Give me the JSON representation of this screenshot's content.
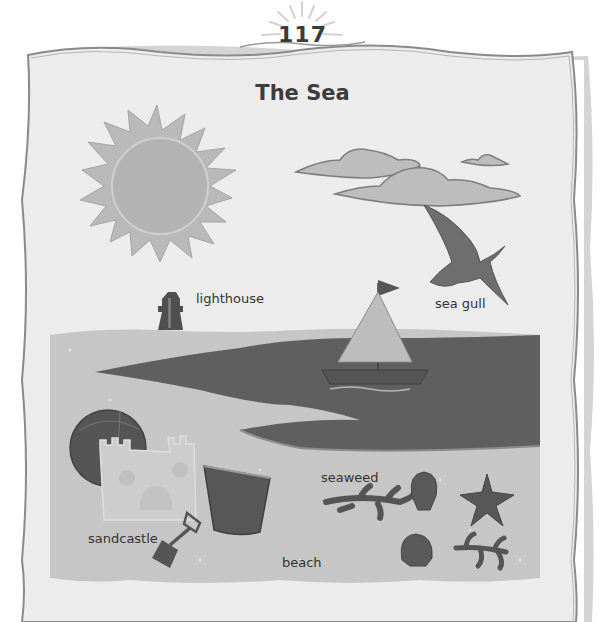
{
  "page": {
    "number": "117",
    "title": "The Sea"
  },
  "labels": {
    "lighthouse": "lighthouse",
    "sea_gull": "sea gull",
    "seaweed": "seaweed",
    "sandcastle": "sandcastle",
    "beach": "beach"
  },
  "colors": {
    "paper": "#ebebeb",
    "border": "#8a8a8a",
    "sand": "#c4c4c4",
    "sea": "#5e5e5e",
    "sun": "#b7b7b7",
    "dark_object": "#5a5a5a",
    "text": "#333333"
  }
}
